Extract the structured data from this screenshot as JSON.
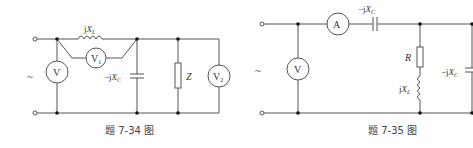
{
  "figures": [
    {
      "caption": "题 7-34 图",
      "source_symbol": "~",
      "components": {
        "inductor": {
          "label_j": "j",
          "label_x": "X",
          "label_sub": "L"
        },
        "capacitor": {
          "label_pre": "−j",
          "label_x": "X",
          "label_sub": "C"
        },
        "impedance": {
          "label": "Z"
        },
        "voltmeter_main": {
          "label": "V"
        },
        "voltmeter_1": {
          "label": "V",
          "sub": "1"
        },
        "voltmeter_2": {
          "label": "V",
          "sub": "2"
        }
      }
    },
    {
      "caption": "题 7-35 图",
      "source_symbol": "~",
      "components": {
        "ammeter": {
          "label": "A"
        },
        "series_capacitor": {
          "label_pre": "−j",
          "label_x": "X",
          "label_sub": "C"
        },
        "resistor": {
          "label": "R"
        },
        "inductor": {
          "label_j": "j",
          "label_x": "X",
          "label_sub": "L"
        },
        "shunt_capacitor": {
          "label_pre": "−j",
          "label_x": "X",
          "label_sub": "C"
        },
        "voltmeter": {
          "label": "V"
        }
      }
    }
  ]
}
